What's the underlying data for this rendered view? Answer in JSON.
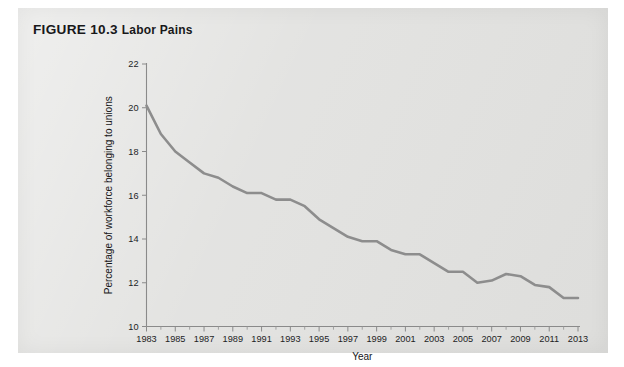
{
  "figure": {
    "number_label": "FIGURE 10.3",
    "name_label": "Labor Pains"
  },
  "chart_data": {
    "type": "line",
    "title": "FIGURE 10.3 Labor Pains",
    "xlabel": "Year",
    "ylabel": "Percentage of workforce belonging to unions",
    "xlim": [
      1983,
      2013
    ],
    "ylim": [
      10,
      22
    ],
    "y_ticks": [
      10,
      12,
      14,
      16,
      18,
      20,
      22
    ],
    "x_ticks": [
      1983,
      1985,
      1987,
      1989,
      1991,
      1993,
      1995,
      1997,
      1999,
      2001,
      2003,
      2005,
      2007,
      2009,
      2011,
      2013
    ],
    "x_minor_step": 1,
    "grid": false,
    "legend": null,
    "line_color": "#8d8d8d",
    "series": [
      {
        "name": "Percentage of workforce belonging to unions",
        "x": [
          1983,
          1984,
          1985,
          1986,
          1987,
          1988,
          1989,
          1990,
          1991,
          1992,
          1993,
          1994,
          1995,
          1996,
          1997,
          1998,
          1999,
          2000,
          2001,
          2002,
          2003,
          2004,
          2005,
          2006,
          2007,
          2008,
          2009,
          2010,
          2011,
          2012,
          2013
        ],
        "values": [
          20.1,
          18.8,
          18.0,
          17.5,
          17.0,
          16.8,
          16.4,
          16.1,
          16.1,
          15.8,
          15.8,
          15.5,
          14.9,
          14.5,
          14.1,
          13.9,
          13.9,
          13.5,
          13.3,
          13.3,
          12.9,
          12.5,
          12.5,
          12.0,
          12.1,
          12.4,
          12.3,
          11.9,
          11.8,
          11.3,
          11.3
        ]
      }
    ]
  },
  "axis": {
    "x_title": "Year",
    "y_title": "Percentage of workforce belonging to unions"
  }
}
